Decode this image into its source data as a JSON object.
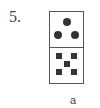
{
  "question": {
    "number_label": "5.",
    "option_label": "a"
  },
  "domino": {
    "top_half": {
      "pips": 3,
      "pip_shape": "circle"
    },
    "bottom_half": {
      "pips": 5,
      "pip_shape": "square"
    },
    "pip_color": "#333333",
    "border_color": "#555555"
  }
}
